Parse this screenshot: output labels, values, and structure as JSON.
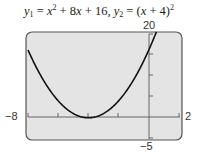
{
  "chart_data": {
    "type": "line",
    "series": [
      {
        "name": "y1 = x^2 + 8x + 16",
        "expression": "x^2 + 8x + 16"
      },
      {
        "name": "y2 = (x + 4)^2",
        "expression": "(x + 4)^2"
      }
    ],
    "x": [
      -8,
      -7,
      -6,
      -5,
      -4,
      -3,
      -2,
      -1,
      0,
      0.47
    ],
    "y": [
      16,
      9,
      4,
      1,
      0,
      1,
      4,
      9,
      16,
      20
    ],
    "xlim": [
      -8,
      2
    ],
    "ylim": [
      -5,
      20
    ],
    "xscale": 2,
    "yscale": 5,
    "tick_labels": {
      "xmin": "-8",
      "xmax": "2",
      "ymin": "-5",
      "ymax": "20"
    },
    "grid": false,
    "legend": "none",
    "background": "#e4e4e4",
    "curve_color": "#111111"
  },
  "title": {
    "y1": "y",
    "sub1": "1",
    "eq1": " = ",
    "x1": "x",
    "sup1": "2",
    "rest1": " + 8",
    "x2": "x",
    "rest2": " + 16,  ",
    "y2": "y",
    "sub2": "2",
    "eq2": " = (",
    "x3": "x",
    "rest3": " + 4)",
    "sup2": "2"
  },
  "labels": {
    "xmin": "−8",
    "xmax": "2",
    "ymin": "−5",
    "ymax": "20"
  }
}
